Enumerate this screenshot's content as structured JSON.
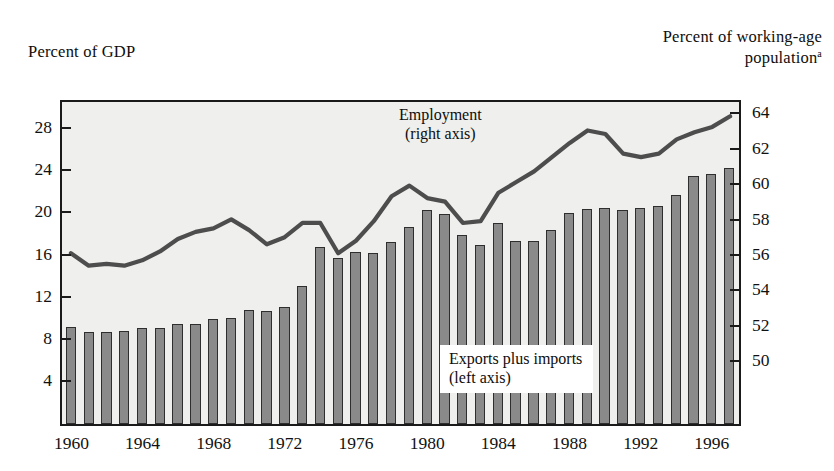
{
  "axis_titles": {
    "left": "Percent of GDP",
    "right_line1": "Percent of working-age",
    "right_line2": "population",
    "right_superscript": "a"
  },
  "annotations": {
    "employment_line1": "Employment",
    "employment_line2": "(right axis)",
    "exports_line1": "Exports plus imports",
    "exports_line2": "(left axis)"
  },
  "colors": {
    "bar_fill": "#8a8a8a",
    "bar_stroke": "#2e2e2e",
    "line": "#4d4d4d",
    "plot_background": "#efefed",
    "frame": "#1a1a1a"
  },
  "chart_data": {
    "type": "bar",
    "title": "",
    "xlabel": "",
    "grid": false,
    "legend": "inline-annotations",
    "x_tick_labels": [
      "1960",
      "1964",
      "1968",
      "1972",
      "1976",
      "1980",
      "1984",
      "1988",
      "1992",
      "1996"
    ],
    "x_tick_years": [
      1960,
      1964,
      1968,
      1972,
      1976,
      1980,
      1984,
      1988,
      1992,
      1996
    ],
    "x_range": [
      1960,
      1997
    ],
    "left_axis": {
      "label": "Percent of GDP",
      "ticks": [
        4,
        8,
        12,
        16,
        20,
        24,
        28
      ],
      "ylim": [
        0,
        30.4
      ]
    },
    "right_axis": {
      "label": "Percent of working-age population",
      "ticks": [
        50,
        52,
        54,
        56,
        58,
        60,
        62,
        64
      ],
      "ylim": [
        46.5,
        64.6
      ]
    },
    "series": [
      {
        "name": "Exports plus imports",
        "axis": "left",
        "type": "bar",
        "units": "Percent of GDP",
        "categories": [
          1960,
          1961,
          1962,
          1963,
          1964,
          1965,
          1966,
          1967,
          1968,
          1969,
          1970,
          1971,
          1972,
          1973,
          1974,
          1975,
          1976,
          1977,
          1978,
          1979,
          1980,
          1981,
          1982,
          1983,
          1984,
          1985,
          1986,
          1987,
          1988,
          1989,
          1990,
          1991,
          1992,
          1993,
          1994,
          1995,
          1996,
          1997
        ],
        "values": [
          9.2,
          8.7,
          8.7,
          8.8,
          9.1,
          9.1,
          9.5,
          9.5,
          9.9,
          10.0,
          10.8,
          10.7,
          11.1,
          13.1,
          16.8,
          15.7,
          16.3,
          16.2,
          17.2,
          18.7,
          20.3,
          19.9,
          17.9,
          17.0,
          19.0,
          17.3,
          17.3,
          18.4,
          20.0,
          20.4,
          20.5,
          20.3,
          20.5,
          20.6,
          21.7,
          23.5,
          23.7,
          24.2
        ]
      },
      {
        "name": "Employment",
        "axis": "right",
        "type": "line",
        "units": "Percent of working-age population",
        "categories": [
          1960,
          1961,
          1962,
          1963,
          1964,
          1965,
          1966,
          1967,
          1968,
          1969,
          1970,
          1971,
          1972,
          1973,
          1974,
          1975,
          1976,
          1977,
          1978,
          1979,
          1980,
          1981,
          1982,
          1983,
          1984,
          1985,
          1986,
          1987,
          1988,
          1989,
          1990,
          1991,
          1992,
          1993,
          1994,
          1995,
          1996,
          1997
        ],
        "values": [
          56.1,
          55.4,
          55.5,
          55.4,
          55.7,
          56.2,
          56.9,
          57.3,
          57.5,
          58.0,
          57.4,
          56.6,
          57.0,
          57.8,
          57.8,
          56.1,
          56.8,
          57.9,
          59.3,
          59.9,
          59.2,
          59.0,
          57.8,
          57.9,
          59.5,
          60.1,
          60.7,
          61.5,
          62.3,
          63.0,
          62.8,
          61.7,
          61.5,
          61.7,
          62.5,
          62.9,
          63.2,
          63.8
        ]
      }
    ]
  }
}
